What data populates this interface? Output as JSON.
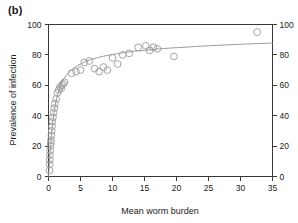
{
  "figure": {
    "panel_label": "(b)",
    "width": 298,
    "height": 223,
    "background": "#ffffff"
  },
  "style": {
    "axis_color": "#3a3a3a",
    "point_color": "#9a9a9a",
    "curve_color": "#8f8f8f",
    "text_color": "#1a1a1a"
  },
  "chart_data": {
    "type": "scatter",
    "title": "",
    "subtitle": "",
    "panel": "(b)",
    "xlabel": "Mean worm burden",
    "ylabel": "Prevalence of infection",
    "ylabel_right": "",
    "xlim": [
      0,
      35
    ],
    "ylim": [
      0,
      100
    ],
    "xticks": [
      0,
      5,
      10,
      15,
      20,
      25,
      30,
      35
    ],
    "xticklabels": [
      "0",
      "5",
      "10",
      "15",
      "20",
      "25",
      "30",
      "35"
    ],
    "yticks": [
      0,
      20,
      40,
      60,
      80,
      100
    ],
    "yticklabels": [
      "0",
      "20",
      "40",
      "60",
      "80",
      "100"
    ],
    "yticks_right": [
      0,
      20,
      40,
      60,
      80,
      100
    ],
    "yticklabels_right": [
      "0",
      "20",
      "40",
      "60",
      "80",
      "100"
    ],
    "grid": false,
    "legend": false,
    "legend_position": "none",
    "marker": "open-circle",
    "marker_size": 4,
    "points": [
      {
        "x": 0.15,
        "y": 4
      },
      {
        "x": 0.18,
        "y": 8
      },
      {
        "x": 0.2,
        "y": 11
      },
      {
        "x": 0.22,
        "y": 14
      },
      {
        "x": 0.25,
        "y": 17
      },
      {
        "x": 0.3,
        "y": 20
      },
      {
        "x": 0.35,
        "y": 22
      },
      {
        "x": 0.4,
        "y": 24
      },
      {
        "x": 0.45,
        "y": 27
      },
      {
        "x": 0.5,
        "y": 30
      },
      {
        "x": 0.55,
        "y": 33
      },
      {
        "x": 0.6,
        "y": 36
      },
      {
        "x": 0.7,
        "y": 39
      },
      {
        "x": 0.8,
        "y": 42
      },
      {
        "x": 0.9,
        "y": 45
      },
      {
        "x": 1.0,
        "y": 48
      },
      {
        "x": 1.2,
        "y": 51
      },
      {
        "x": 1.4,
        "y": 55
      },
      {
        "x": 1.6,
        "y": 57
      },
      {
        "x": 1.8,
        "y": 59
      },
      {
        "x": 2.0,
        "y": 58
      },
      {
        "x": 2.1,
        "y": 60
      },
      {
        "x": 2.3,
        "y": 61
      },
      {
        "x": 2.5,
        "y": 62
      },
      {
        "x": 3.6,
        "y": 68
      },
      {
        "x": 4.3,
        "y": 69
      },
      {
        "x": 5.0,
        "y": 70
      },
      {
        "x": 5.6,
        "y": 75
      },
      {
        "x": 6.4,
        "y": 76
      },
      {
        "x": 7.2,
        "y": 71
      },
      {
        "x": 7.9,
        "y": 69
      },
      {
        "x": 8.6,
        "y": 72
      },
      {
        "x": 9.2,
        "y": 70
      },
      {
        "x": 10.0,
        "y": 78
      },
      {
        "x": 10.8,
        "y": 74
      },
      {
        "x": 11.6,
        "y": 80
      },
      {
        "x": 12.6,
        "y": 81
      },
      {
        "x": 14.0,
        "y": 85
      },
      {
        "x": 15.2,
        "y": 86
      },
      {
        "x": 15.8,
        "y": 83
      },
      {
        "x": 16.4,
        "y": 85
      },
      {
        "x": 17.0,
        "y": 84
      },
      {
        "x": 19.6,
        "y": 79
      },
      {
        "x": 32.6,
        "y": 95
      }
    ],
    "fit_curve": {
      "label": "fitted saturating curve",
      "model": "asymptotic",
      "x": [
        0.0,
        0.2,
        0.4,
        0.6,
        0.9,
        1.2,
        1.6,
        2.0,
        2.6,
        3.2,
        4.0,
        5.0,
        6.0,
        7.5,
        9.0,
        11.0,
        13.0,
        15.0,
        18.0,
        21.0,
        25.0,
        29.0,
        33.0,
        35.0
      ],
      "y": [
        0.0,
        13.0,
        24.0,
        33.0,
        43.0,
        50.0,
        56.5,
        61.0,
        65.5,
        68.5,
        71.5,
        74.0,
        76.0,
        78.0,
        79.5,
        81.0,
        82.2,
        83.0,
        84.2,
        85.0,
        86.0,
        86.8,
        87.5,
        87.8
      ]
    }
  }
}
